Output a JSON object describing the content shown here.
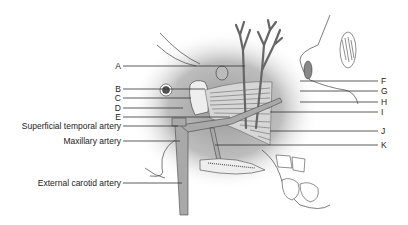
{
  "diagram": {
    "type": "anatomical illustration",
    "left_labels": [
      {
        "id": "A",
        "text": "A",
        "y": 66
      },
      {
        "id": "B",
        "text": "B",
        "y": 89
      },
      {
        "id": "C",
        "text": "C",
        "y": 98
      },
      {
        "id": "D",
        "text": "D",
        "y": 108
      },
      {
        "id": "E",
        "text": "E",
        "y": 117
      },
      {
        "id": "superficial-temporal-artery",
        "text": "Superficial temporal artery",
        "y": 126
      },
      {
        "id": "maxillary-artery",
        "text": "Maxillary artery",
        "y": 141
      },
      {
        "id": "external-carotid-artery",
        "text": "External carotid artery",
        "y": 183
      }
    ],
    "right_labels": [
      {
        "id": "F",
        "text": "F",
        "y": 81
      },
      {
        "id": "G",
        "text": "G",
        "y": 91
      },
      {
        "id": "H",
        "text": "H",
        "y": 102
      },
      {
        "id": "I",
        "text": "I",
        "y": 112
      },
      {
        "id": "J",
        "text": "J",
        "y": 131
      },
      {
        "id": "K",
        "text": "K",
        "y": 145
      }
    ],
    "colors": {
      "artery": "#a9a9a9",
      "shade": "#c8c8c8",
      "line": "#333333",
      "background": "#ffffff"
    }
  }
}
